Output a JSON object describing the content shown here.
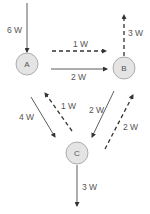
{
  "nodes": [
    {
      "id": "A",
      "label": "A",
      "cx": 27,
      "cy": 64
    },
    {
      "id": "B",
      "label": "B",
      "cx": 124,
      "cy": 68
    },
    {
      "id": "C",
      "label": "C",
      "cx": 77,
      "cy": 153
    }
  ],
  "edges": [
    {
      "from": "external",
      "to": "A",
      "label": "6 W",
      "style": "solid"
    },
    {
      "from": "A",
      "to": "B",
      "label": "1 W",
      "style": "dashed"
    },
    {
      "from": "A",
      "to": "B",
      "label": "2 W",
      "style": "solid"
    },
    {
      "from": "B",
      "to": "external",
      "label": "3 W",
      "style": "dashed"
    },
    {
      "from": "A",
      "to": "C",
      "label": "4 W",
      "style": "solid"
    },
    {
      "from": "C",
      "to": "A",
      "label": "1 W",
      "style": "dashed"
    },
    {
      "from": "B",
      "to": "C",
      "label": "2 W",
      "style": "solid"
    },
    {
      "from": "C",
      "to": "B",
      "label": "2 W",
      "style": "dashed"
    },
    {
      "from": "C",
      "to": "external",
      "label": "3 W",
      "style": "solid"
    }
  ],
  "colors": {
    "node_fill": "#e4e4e4",
    "node_stroke": "#9a9a9a",
    "line": "#333333",
    "text": "#555555"
  }
}
